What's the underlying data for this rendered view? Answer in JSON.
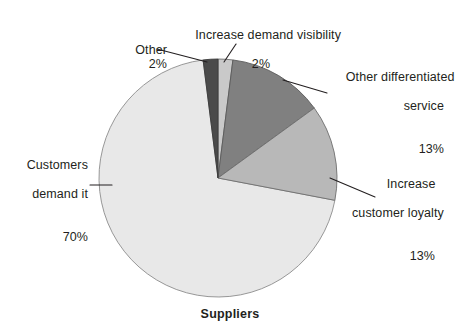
{
  "chart_data": {
    "type": "pie",
    "title": "Suppliers",
    "xlabel": "",
    "ylabel": "",
    "legend_position": "none",
    "grid": false,
    "units": "percent",
    "categories": [
      "Increase demand visibility",
      "Other differentiated service",
      "Increase customer loyalty",
      "Customers demand it",
      "Other"
    ],
    "values": [
      2,
      13,
      13,
      70,
      2
    ],
    "value_labels": [
      "2%",
      "13%",
      "13%",
      "70%",
      "2%"
    ],
    "colors": [
      "#c9c9c9",
      "#808080",
      "#b8b8b8",
      "#e8e8e8",
      "#4a4a4a"
    ],
    "start_angle_deg": -90,
    "direction": "clockwise",
    "slices": [
      {
        "name": "Increase demand visibility",
        "value": 2,
        "value_label": "2%",
        "color": "#c9c9c9",
        "label_lines": [
          "Increase demand visibility",
          "2%"
        ]
      },
      {
        "name": "Other differentiated service",
        "value": 13,
        "value_label": "13%",
        "color": "#808080",
        "label_lines": [
          "Other differentiated",
          "service",
          "13%"
        ]
      },
      {
        "name": "Increase customer loyalty",
        "value": 13,
        "value_label": "13%",
        "color": "#b8b8b8",
        "label_lines": [
          "Increase",
          "customer loyalty",
          "13%"
        ]
      },
      {
        "name": "Customers demand it",
        "value": 70,
        "value_label": "70%",
        "color": "#e8e8e8",
        "label_lines": [
          "Customers",
          "demand it",
          "70%"
        ]
      },
      {
        "name": "Other",
        "value": 2,
        "value_label": "2%",
        "color": "#4a4a4a",
        "label_lines": [
          "Other",
          "2%"
        ]
      }
    ]
  },
  "labels": {
    "other": {
      "line1": "Other",
      "pct": "2%"
    },
    "visibility": {
      "line1": "Increase demand visibility",
      "pct": "2%"
    },
    "differentiated": {
      "line1": "Other differentiated",
      "line2": "service",
      "pct": "13%"
    },
    "loyalty": {
      "line1": "Increase",
      "line2": "customer loyalty",
      "pct": "13%"
    },
    "customers": {
      "line1": "Customers",
      "line2": "demand it",
      "pct": "70%"
    }
  },
  "title": "Suppliers"
}
